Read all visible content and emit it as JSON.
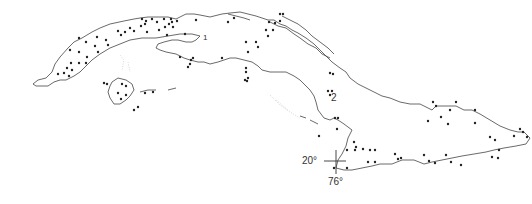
{
  "map": {
    "subject": "Cuba",
    "labels": [
      {
        "id": "region-1",
        "text": "1",
        "x": 203,
        "y": 33
      },
      {
        "id": "region-2",
        "text": "2",
        "x": 331,
        "y": 93
      }
    ],
    "graticule": {
      "latitude_label": "20°",
      "longitude_label": "76°",
      "cross_x": 336,
      "cross_y": 161
    },
    "colors": {
      "coastline": "#444444",
      "points": "#222222",
      "shoals": "#bbbbbb",
      "background": "#ffffff"
    },
    "points": [
      [
        79,
        38
      ],
      [
        86,
        42
      ],
      [
        97,
        37
      ],
      [
        106,
        40
      ],
      [
        95,
        46
      ],
      [
        108,
        45
      ],
      [
        70,
        50
      ],
      [
        79,
        52
      ],
      [
        87,
        57
      ],
      [
        98,
        52
      ],
      [
        71,
        63
      ],
      [
        79,
        63
      ],
      [
        86,
        63
      ],
      [
        67,
        68
      ],
      [
        72,
        70
      ],
      [
        64,
        73
      ],
      [
        69,
        76
      ],
      [
        58,
        74
      ],
      [
        121,
        35
      ],
      [
        118,
        31
      ],
      [
        125,
        32
      ],
      [
        130,
        28
      ],
      [
        134,
        31
      ],
      [
        141,
        26
      ],
      [
        142,
        19
      ],
      [
        146,
        21
      ],
      [
        152,
        19
      ],
      [
        145,
        24
      ],
      [
        157,
        22
      ],
      [
        164,
        19
      ],
      [
        171,
        19
      ],
      [
        169,
        24
      ],
      [
        165,
        27
      ],
      [
        173,
        27
      ],
      [
        172,
        22
      ],
      [
        177,
        21
      ],
      [
        147,
        32
      ],
      [
        159,
        30
      ],
      [
        167,
        35
      ],
      [
        185,
        34
      ],
      [
        196,
        20
      ],
      [
        228,
        22
      ],
      [
        234,
        18
      ],
      [
        246,
        42
      ],
      [
        256,
        42
      ],
      [
        258,
        47
      ],
      [
        180,
        57
      ],
      [
        193,
        58
      ],
      [
        190,
        64
      ],
      [
        188,
        67
      ],
      [
        191,
        60
      ],
      [
        222,
        58
      ],
      [
        248,
        52
      ],
      [
        246,
        68
      ],
      [
        246,
        72
      ],
      [
        248,
        78
      ],
      [
        245,
        80
      ],
      [
        247,
        81
      ],
      [
        280,
        14
      ],
      [
        283,
        14
      ],
      [
        280,
        21
      ],
      [
        269,
        22
      ],
      [
        275,
        23
      ],
      [
        273,
        30
      ],
      [
        268,
        36
      ],
      [
        266,
        30
      ],
      [
        330,
        73
      ],
      [
        333,
        74
      ],
      [
        328,
        91
      ],
      [
        332,
        91
      ],
      [
        330,
        95
      ],
      [
        122,
        84
      ],
      [
        126,
        86
      ],
      [
        118,
        93
      ],
      [
        126,
        95
      ],
      [
        121,
        99
      ],
      [
        145,
        93
      ],
      [
        153,
        92
      ],
      [
        138,
        107
      ],
      [
        134,
        110
      ],
      [
        107,
        84
      ],
      [
        104,
        83
      ],
      [
        319,
        136
      ],
      [
        335,
        118
      ],
      [
        338,
        118
      ],
      [
        337,
        129
      ],
      [
        354,
        142
      ],
      [
        356,
        147
      ],
      [
        355,
        150
      ],
      [
        363,
        149
      ],
      [
        370,
        150
      ],
      [
        368,
        162
      ],
      [
        375,
        162
      ],
      [
        375,
        150
      ],
      [
        395,
        154
      ],
      [
        398,
        159
      ],
      [
        401,
        158
      ],
      [
        428,
        121
      ],
      [
        441,
        117
      ],
      [
        436,
        106
      ],
      [
        433,
        102
      ],
      [
        448,
        124
      ],
      [
        450,
        110
      ],
      [
        456,
        102
      ],
      [
        475,
        110
      ],
      [
        475,
        123
      ],
      [
        495,
        140
      ],
      [
        499,
        150
      ],
      [
        492,
        157
      ],
      [
        498,
        158
      ],
      [
        490,
        137
      ],
      [
        514,
        136
      ],
      [
        520,
        129
      ],
      [
        527,
        137
      ],
      [
        523,
        132
      ],
      [
        424,
        155
      ],
      [
        429,
        161
      ],
      [
        435,
        163
      ],
      [
        451,
        162
      ],
      [
        461,
        165
      ],
      [
        446,
        155
      ],
      [
        347,
        150
      ],
      [
        334,
        168
      ],
      [
        347,
        168
      ]
    ]
  }
}
